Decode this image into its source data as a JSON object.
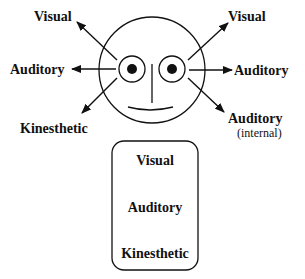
{
  "diagram": {
    "left_labels": {
      "visual": "Visual",
      "auditory": "Auditory",
      "kinesthetic": "Kinesthetic"
    },
    "right_labels": {
      "visual": "Visual",
      "auditory": "Auditory",
      "auditory_internal": "Auditory",
      "internal_note": "(internal)"
    },
    "box_labels": {
      "visual": "Visual",
      "auditory": "Auditory",
      "kinesthetic": "Kinesthetic"
    },
    "colors": {
      "stroke": "#111111",
      "background": "#ffffff"
    }
  }
}
